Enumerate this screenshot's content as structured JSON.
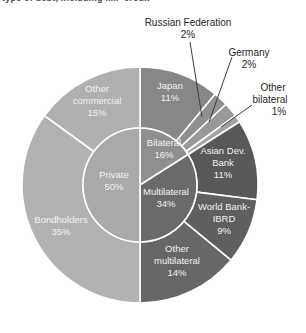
{
  "caption_clipped": "type of debt, including IMF credit",
  "chart_data": {
    "type": "pie",
    "subtype": "double-ring-donut",
    "title": "",
    "legend": "none",
    "center_hole": false,
    "inner_series": {
      "name": "creditor-category",
      "slices": [
        {
          "id": "bilateral",
          "label": "Bilateral",
          "value": 16
        },
        {
          "id": "multilateral",
          "label": "Multilateral",
          "value": 34
        },
        {
          "id": "private",
          "label": "Private",
          "value": 50
        }
      ]
    },
    "outer_series": {
      "name": "creditor-detail",
      "slices": [
        {
          "id": "japan",
          "label": "Japan",
          "value": 11
        },
        {
          "id": "russian-federation",
          "label": "Russian Federation",
          "value": 2
        },
        {
          "id": "germany",
          "label": "Germany",
          "value": 2
        },
        {
          "id": "other-bilateral",
          "label": "Other bilateral",
          "value": 1
        },
        {
          "id": "asian-dev-bank",
          "label": "Asian Dev. Bank",
          "value": 11
        },
        {
          "id": "world-bank-ibrd",
          "label": "World Bank-IBRD",
          "value": 9
        },
        {
          "id": "other-multilateral",
          "label": "Other multilateral",
          "value": 14
        },
        {
          "id": "bondholders",
          "label": "Bondholders",
          "value": 35
        },
        {
          "id": "other-commercial",
          "label": "Other commercial",
          "value": 15
        }
      ]
    },
    "colors": {
      "bilateral": "#8f8f8f",
      "multilateral": "#6a6a6a",
      "private": "#a9a9a9",
      "japan": "#878787",
      "russian-federation": "#909090",
      "germany": "#999999",
      "other-bilateral": "#a2a2a2",
      "asian-dev-bank": "#585858",
      "world-bank-ibrd": "#5f5f5f",
      "other-multilateral": "#676767",
      "bondholders": "#b2b2b2",
      "other-commercial": "#b0b0b0"
    },
    "separator_color": "#ffffff",
    "inside_label_color": "#f2f2f2",
    "callout_label_color": "#262626",
    "leader_line_color": "#3d3d3d",
    "percent_suffix": "%"
  }
}
